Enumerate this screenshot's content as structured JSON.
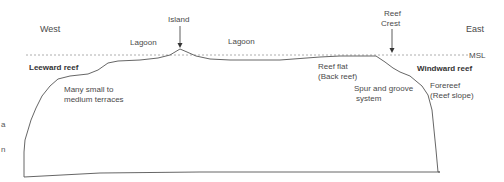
{
  "diagram": {
    "directions": {
      "west": "West",
      "east": "East"
    },
    "sea_level": "MSL",
    "labels": {
      "island": "Island",
      "reef_crest_line1": "Reef",
      "reef_crest_line2": "Crest",
      "lagoon_left": "Lagoon",
      "lagoon_right": "Lagoon",
      "leeward_reef": "Leeward reef",
      "windward_reef": "Windward reef",
      "terraces_line1": "Many small to",
      "terraces_line2": "medium  terraces",
      "reef_flat_line1": "Reef flat",
      "reef_flat_line2": "(Back reef)",
      "spur_line1": "Spur and groove",
      "spur_line2": "system",
      "forereef_line1": "Forereef",
      "forereef_line2": "(Reef slope)"
    },
    "clipped_edge_glyphs": [
      "a",
      "n"
    ],
    "colors": {
      "profile_line": "#555555",
      "msl_line": "#888888",
      "text": "#4a4a4a"
    }
  }
}
